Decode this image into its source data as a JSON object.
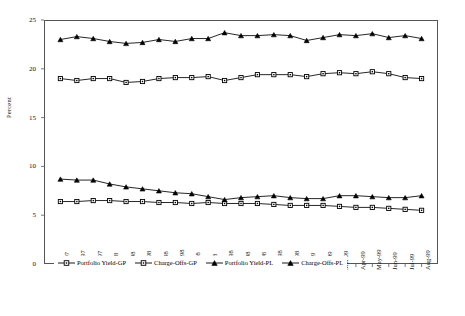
{
  "chart_data": {
    "type": "line",
    "title": "",
    "xlabel": "",
    "ylabel": "Percent",
    "ylim": [
      0,
      25
    ],
    "yticks": [
      0,
      5,
      10,
      15,
      20,
      25
    ],
    "ytick_labels": [
      "0",
      "5",
      "10",
      "15",
      "20",
      "25"
    ],
    "grid": false,
    "legend_position": "bottom",
    "categories": [
      "Oct-97",
      "Nov-97",
      "Dec-97",
      "Jan-98",
      "Feb-98",
      "Mar-98",
      "Apr-98",
      "May-98",
      "Jun-98",
      "Jul-98",
      "Aug-98",
      "Sep-98",
      "Oct-98",
      "Nov-98",
      "Dec-98",
      "Jan-99",
      "Feb-99",
      "Mar-99",
      "Apr-99",
      "May-99",
      "Jun-99",
      "Jul-99",
      "Aug-99"
    ],
    "series": [
      {
        "name": "Portfolio Yield-GP",
        "marker": "square",
        "values": [
          19.0,
          18.8,
          19.0,
          19.0,
          18.6,
          18.7,
          19.0,
          19.1,
          19.1,
          19.2,
          18.8,
          19.1,
          19.4,
          19.4,
          19.4,
          19.2,
          19.5,
          19.6,
          19.5,
          19.7,
          19.5,
          19.1,
          19.0
        ]
      },
      {
        "name": "Charge-Offs-GP",
        "marker": "square",
        "values": [
          6.4,
          6.4,
          6.5,
          6.5,
          6.4,
          6.4,
          6.3,
          6.3,
          6.2,
          6.3,
          6.2,
          6.2,
          6.2,
          6.1,
          6.0,
          6.0,
          6.0,
          5.9,
          5.8,
          5.8,
          5.7,
          5.6,
          5.5
        ]
      },
      {
        "name": "Portfolio Yield-PL",
        "marker": "triangle",
        "values": [
          23.0,
          23.3,
          23.1,
          22.8,
          22.6,
          22.7,
          23.0,
          22.8,
          23.1,
          23.1,
          23.7,
          23.4,
          23.4,
          23.5,
          23.4,
          22.9,
          23.2,
          23.5,
          23.4,
          23.6,
          23.2,
          23.4,
          23.1
        ]
      },
      {
        "name": "Charge-Offs-PL",
        "marker": "triangle",
        "values": [
          8.7,
          8.6,
          8.6,
          8.2,
          7.9,
          7.7,
          7.5,
          7.3,
          7.2,
          6.9,
          6.6,
          6.8,
          6.9,
          7.0,
          6.8,
          6.7,
          6.7,
          7.0,
          7.0,
          6.9,
          6.8,
          6.8,
          7.0
        ]
      }
    ]
  }
}
